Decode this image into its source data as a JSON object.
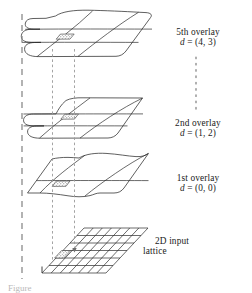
{
  "figure": {
    "type": "diagram",
    "caption": "Figure",
    "labels": {
      "overlay5": {
        "line1": "5th overlay",
        "d_prefix": "d",
        "d_eq": " = (4, 3)"
      },
      "overlay2": {
        "line1": "2nd overlay",
        "d_prefix": "d",
        "d_eq": " = (1, 2)"
      },
      "overlay1": {
        "line1": "1st overlay",
        "d_prefix": "d",
        "d_eq": " = (0, 0)"
      },
      "lattice": {
        "line1": "2D input",
        "line2": "lattice"
      }
    },
    "colors": {
      "ink": "#1a1a1a",
      "sheet_stroke": "#2b2b2b",
      "guide_dash": "#8a8a8a",
      "projection_dash": "#9a9a9a",
      "shaded_cell": "#d6d6d6",
      "background": "#ffffff"
    },
    "geometry": {
      "lattice_cols": 7,
      "lattice_rows": 6,
      "overlay_count": 3,
      "ellipsis_dots": 9
    }
  }
}
